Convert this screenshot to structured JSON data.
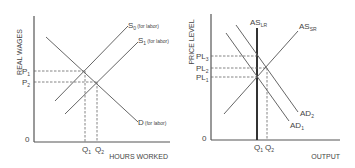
{
  "left_diagram": {
    "y_axis_label": "REAL WAGES",
    "x_axis_label": "HOURS WORKED",
    "origin": "0",
    "curves": {
      "s0": {
        "main": "S",
        "sub": "0",
        "note": "(for labor)"
      },
      "s1": {
        "main": "S",
        "sub": "1",
        "note": "(for labor)"
      },
      "d": {
        "main": "D",
        "note": "(for labor)"
      }
    },
    "y_ticks": [
      {
        "main": "P",
        "sub": "1"
      },
      {
        "main": "P",
        "sub": "2"
      }
    ],
    "x_ticks": [
      {
        "main": "Q",
        "sub": "1"
      },
      {
        "main": "Q",
        "sub": "2"
      }
    ]
  },
  "right_diagram": {
    "y_axis_label": "PRICE LEVEL",
    "x_axis_label": "OUTPUT",
    "origin": "0",
    "curves": {
      "aslr": {
        "main": "AS",
        "sub": "LR"
      },
      "assr": {
        "main": "AS",
        "sub": "SR"
      },
      "ad2": {
        "main": "AD",
        "sub": "2"
      },
      "ad1": {
        "main": "AD",
        "sub": "1"
      }
    },
    "y_ticks": [
      {
        "main": "PL",
        "sub": "3"
      },
      {
        "main": "PL",
        "sub": "2"
      },
      {
        "main": "PL",
        "sub": "1"
      }
    ],
    "x_ticks": [
      {
        "main": "Q",
        "sub": "1"
      },
      {
        "main": "Q",
        "sub": "2"
      }
    ]
  }
}
